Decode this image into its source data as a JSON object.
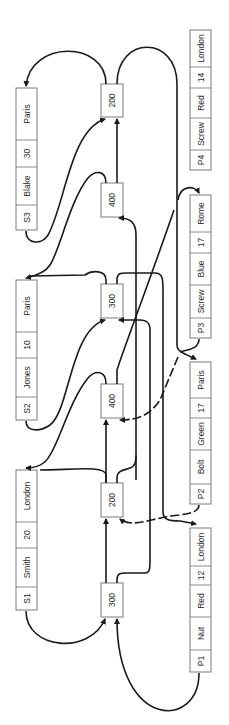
{
  "diagram": {
    "suppliers": [
      {
        "id": "S1",
        "name": "Smith",
        "status": "20",
        "city": "London"
      },
      {
        "id": "S2",
        "name": "Jones",
        "status": "10",
        "city": "Paris"
      },
      {
        "id": "S3",
        "name": "Blake",
        "status": "30",
        "city": "Paris"
      }
    ],
    "parts": [
      {
        "id": "P1",
        "name": "Nut",
        "color": "Red",
        "weight": "12",
        "city": "London"
      },
      {
        "id": "P2",
        "name": "Bolt",
        "color": "Green",
        "weight": "17",
        "city": "Paris"
      },
      {
        "id": "P3",
        "name": "Screw",
        "color": "Blue",
        "weight": "17",
        "city": "Rome"
      },
      {
        "id": "P4",
        "name": "Screw",
        "color": "Red",
        "weight": "14",
        "city": "London"
      }
    ],
    "quantities": [
      {
        "label": "300",
        "supplier": "S1"
      },
      {
        "label": "200",
        "supplier": "S1"
      },
      {
        "label": "400",
        "supplier": "S2"
      },
      {
        "label": "300",
        "supplier": "S2"
      },
      {
        "label": "400",
        "supplier": "S3"
      },
      {
        "label": "200",
        "supplier": "S3"
      }
    ]
  }
}
